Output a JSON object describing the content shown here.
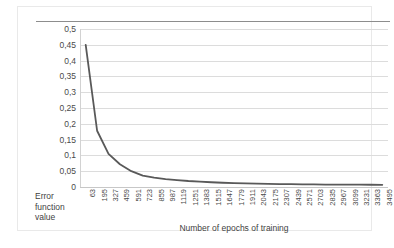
{
  "chart_data": {
    "type": "line",
    "title": "",
    "xlabel": "Number of epochs of training",
    "ylabel": "Error function value",
    "ylabel_lines": [
      "Error",
      "function",
      "value"
    ],
    "xlim": [
      63,
      3495
    ],
    "ylim": [
      0,
      0.5
    ],
    "grid": true,
    "legend": "none",
    "decimal_separator": ",",
    "line_color": "#595959",
    "grid_color": "#dcdcdc",
    "y_ticks": [
      0,
      0.05,
      0.1,
      0.15,
      0.2,
      0.25,
      0.3,
      0.35,
      0.4,
      0.45,
      0.5
    ],
    "y_tick_labels": [
      "0",
      "0,05",
      "0,1",
      "0,15",
      "0,2",
      "0,25",
      "0,3",
      "0,35",
      "0,4",
      "0,45",
      "0,5"
    ],
    "x_tick_labels": [
      "63",
      "195",
      "327",
      "459",
      "591",
      "723",
      "855",
      "987",
      "1119",
      "1251",
      "1383",
      "1515",
      "1647",
      "1779",
      "1911",
      "2043",
      "2175",
      "2307",
      "2439",
      "2571",
      "2703",
      "2835",
      "2967",
      "3099",
      "3231",
      "3363",
      "3495"
    ],
    "x": [
      63,
      195,
      327,
      459,
      591,
      723,
      855,
      987,
      1119,
      1251,
      1383,
      1515,
      1647,
      1779,
      1911,
      2043,
      2175,
      2307,
      2439,
      2571,
      2703,
      2835,
      2967,
      3099,
      3231,
      3363,
      3495
    ],
    "values": [
      0.45,
      0.178,
      0.105,
      0.072,
      0.05,
      0.036,
      0.03,
      0.025,
      0.022,
      0.019,
      0.017,
      0.015,
      0.0135,
      0.0125,
      0.0115,
      0.0105,
      0.0098,
      0.0092,
      0.0088,
      0.0084,
      0.008,
      0.0078,
      0.0076,
      0.0074,
      0.0072,
      0.0071,
      0.007
    ],
    "series": [
      {
        "name": "Error function value",
        "values": [
          0.45,
          0.178,
          0.105,
          0.072,
          0.05,
          0.036,
          0.03,
          0.025,
          0.022,
          0.019,
          0.017,
          0.015,
          0.0135,
          0.0125,
          0.0115,
          0.0105,
          0.0098,
          0.0092,
          0.0088,
          0.0084,
          0.008,
          0.0078,
          0.0076,
          0.0074,
          0.0072,
          0.0071,
          0.007
        ]
      }
    ]
  }
}
